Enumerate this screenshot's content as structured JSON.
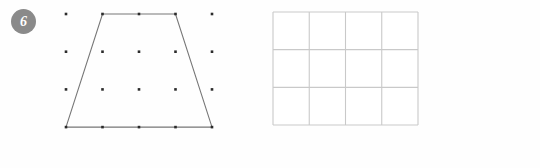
{
  "worksheet": {
    "question_number": "6",
    "background_color": "#fefefe"
  },
  "badge": {
    "label": "6",
    "fill_color": "#8a8a8a",
    "text_color": "#ffffff",
    "cx": 23.5,
    "cy": 21.5,
    "r": 12.5
  },
  "dot_grid": {
    "name": "dot-grid",
    "columns": 5,
    "rows": 4,
    "origin_x": 66,
    "origin_y": 14,
    "spacing_x": 36.5,
    "spacing_y": 37.7,
    "dot_size": 2.6,
    "dot_color": "#2b2b2b",
    "points": [
      {
        "col": 0,
        "row": 0,
        "x": 66,
        "y": 14
      },
      {
        "col": 1,
        "row": 0,
        "x": 102.5,
        "y": 14
      },
      {
        "col": 2,
        "row": 0,
        "x": 139,
        "y": 14
      },
      {
        "col": 3,
        "row": 0,
        "x": 175.5,
        "y": 14
      },
      {
        "col": 4,
        "row": 0,
        "x": 212,
        "y": 14
      },
      {
        "col": 0,
        "row": 1,
        "x": 66,
        "y": 51.7
      },
      {
        "col": 1,
        "row": 1,
        "x": 102.5,
        "y": 51.7
      },
      {
        "col": 2,
        "row": 1,
        "x": 139,
        "y": 51.7
      },
      {
        "col": 3,
        "row": 1,
        "x": 175.5,
        "y": 51.7
      },
      {
        "col": 4,
        "row": 1,
        "x": 212,
        "y": 51.7
      },
      {
        "col": 0,
        "row": 2,
        "x": 66,
        "y": 89.4
      },
      {
        "col": 1,
        "row": 2,
        "x": 102.5,
        "y": 89.4
      },
      {
        "col": 2,
        "row": 2,
        "x": 139,
        "y": 89.4
      },
      {
        "col": 3,
        "row": 2,
        "x": 175.5,
        "y": 89.4
      },
      {
        "col": 4,
        "row": 2,
        "x": 212,
        "y": 89.4
      },
      {
        "col": 0,
        "row": 3,
        "x": 66,
        "y": 127.1
      },
      {
        "col": 1,
        "row": 3,
        "x": 102.5,
        "y": 127.1
      },
      {
        "col": 2,
        "row": 3,
        "x": 139,
        "y": 127.1
      },
      {
        "col": 3,
        "row": 3,
        "x": 175.5,
        "y": 127.1
      },
      {
        "col": 4,
        "row": 3,
        "x": 212,
        "y": 127.1
      }
    ]
  },
  "trapezoid": {
    "name": "trapezoid-shape",
    "stroke_color": "#767676",
    "stroke_width": 1.1,
    "fill": "none",
    "vertex_grid_points": [
      {
        "col": 1,
        "row": 0
      },
      {
        "col": 3,
        "row": 0
      },
      {
        "col": 4,
        "row": 3
      },
      {
        "col": 0,
        "row": 3
      }
    ],
    "points": "102.5,14 175.5,14 212,127.1 66,127.1"
  },
  "rect_grid": {
    "name": "rectangle-grid",
    "columns": 4,
    "rows": 3,
    "left": 8,
    "top": 12,
    "width": 145,
    "height": 113,
    "stroke_color": "#c9c9c9",
    "stroke_width": 1.1,
    "fill": "#ffffff",
    "vertical_lines_x": [
      8,
      44.25,
      80.5,
      116.75,
      153
    ],
    "horizontal_lines_y": [
      12,
      49.67,
      87.33,
      125
    ]
  }
}
